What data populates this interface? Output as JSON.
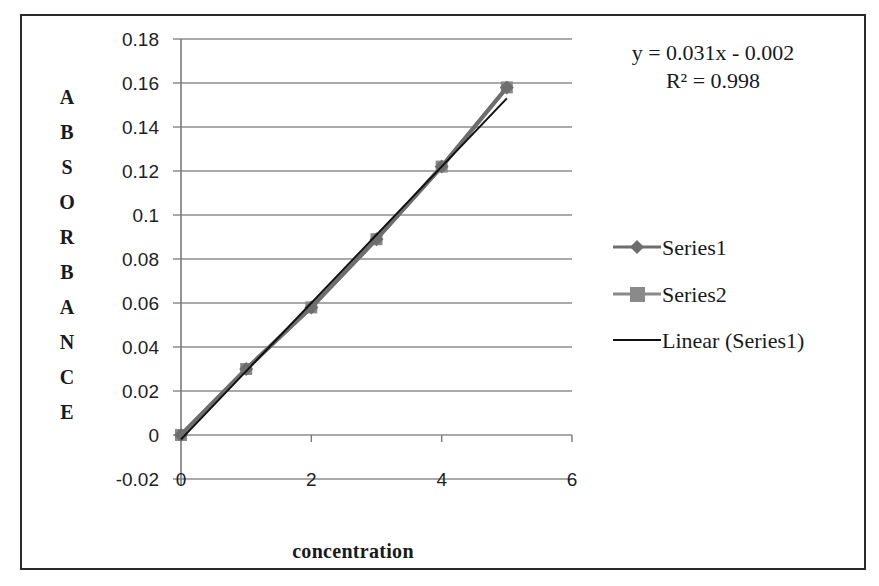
{
  "chart_data": {
    "type": "scatter",
    "title": "",
    "xlabel": "concentration",
    "ylabel": "ABSORBANCE",
    "xlim": [
      0,
      6
    ],
    "ylim": [
      -0.02,
      0.18
    ],
    "x_ticks": [
      "0",
      "2",
      "4",
      "6"
    ],
    "y_ticks": [
      "0.18",
      "0.16",
      "0.14",
      "0.12",
      "0.1",
      "0.08",
      "0.06",
      "0.04",
      "0.02",
      "0",
      "-0.02"
    ],
    "grid": true,
    "legend_position": "right",
    "series": [
      {
        "name": "Series1",
        "marker": "diamond",
        "line": true,
        "color": "#6e6e6e",
        "x": [
          0,
          1,
          2,
          3,
          4,
          5
        ],
        "values": [
          0,
          0.03,
          0.058,
          0.089,
          0.122,
          0.158
        ]
      },
      {
        "name": "Series2",
        "marker": "square",
        "line": true,
        "color": "#8a8a8a",
        "x": [
          0,
          1,
          2,
          3,
          4,
          5
        ],
        "values": [
          0,
          0.03,
          0.058,
          0.089,
          0.122,
          0.158
        ]
      }
    ],
    "trendline": {
      "name": "Linear (Series1)",
      "type": "linear",
      "slope": 0.031,
      "intercept": -0.002,
      "color": "#111111"
    },
    "annotations": {
      "equation": "y = 0.031x - 0.002",
      "r_squared": "R² = 0.998"
    }
  },
  "ylabel_letters": [
    "A",
    "B",
    "S",
    "O",
    "R",
    "B",
    "A",
    "N",
    "C",
    "E"
  ],
  "legend": {
    "items": [
      {
        "label": "Series1"
      },
      {
        "label": "Series2"
      },
      {
        "label": "Linear (Series1)"
      }
    ]
  }
}
